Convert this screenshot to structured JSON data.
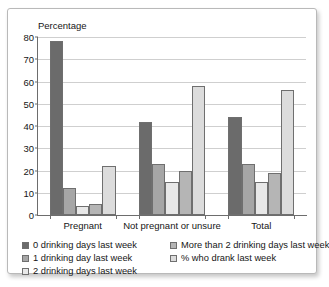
{
  "chart_data": {
    "type": "bar",
    "title": "",
    "xlabel": "",
    "ylabel": "Percentage",
    "ylim": [
      0,
      80
    ],
    "ytick_step": 10,
    "yticks": [
      0,
      10,
      20,
      30,
      40,
      50,
      60,
      70,
      80
    ],
    "grid": true,
    "legend_position": "bottom",
    "categories": [
      "Pregnant",
      "Not pregnant or unsure",
      "Total"
    ],
    "series": [
      {
        "name": "0 drinking days last week",
        "color": "#6b6b6b",
        "values": [
          78,
          42,
          44
        ]
      },
      {
        "name": "1 drinking day last week",
        "color": "#a6a6a6",
        "values": [
          12,
          23,
          23
        ]
      },
      {
        "name": "2 drinking days last week",
        "color": "#e8e8e8",
        "values": [
          4,
          15,
          15
        ]
      },
      {
        "name": "More than 2 drinking days last week",
        "color": "#b5b5b5",
        "values": [
          5,
          20,
          19
        ]
      },
      {
        "name": "% who drank last week",
        "color": "#dcdcdc",
        "values": [
          22,
          58,
          56
        ]
      }
    ]
  },
  "axis": {
    "y_title": "Percentage"
  },
  "legend": {
    "left_column": [
      "0 drinking days last week",
      "1 drinking day last week",
      "2 drinking days last week"
    ],
    "right_column": [
      "More than 2 drinking days last week",
      "% who drank last week"
    ]
  }
}
